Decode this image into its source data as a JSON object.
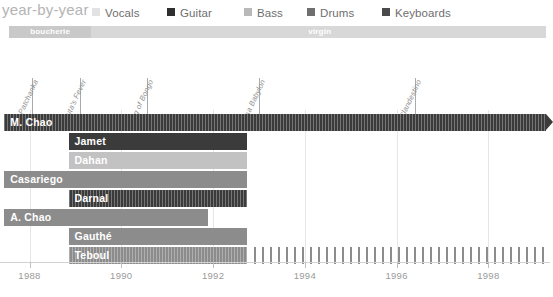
{
  "header": {
    "title": "year-by-year",
    "legend": [
      {
        "label": "Vocals",
        "color": "#e2e2e2",
        "x": 0
      },
      {
        "label": "Guitar",
        "color": "#2f2f2f",
        "x": 75
      },
      {
        "label": "Bass",
        "color": "#b9b9b9",
        "x": 152
      },
      {
        "label": "Drums",
        "color": "#6f6f6f",
        "x": 215
      },
      {
        "label": "Keyboards",
        "color": "#4a4a4a",
        "x": 290
      }
    ]
  },
  "label_band": {
    "segments": [
      {
        "name": "boucherie",
        "start": 1987.55,
        "end": 1989.35
      },
      {
        "name": "virgin",
        "start": 1989.35,
        "end": 1999.3
      }
    ]
  },
  "albums": [
    {
      "title": "Patchanka",
      "year": 1988.05
    },
    {
      "title": "Puta's Fever",
      "year": 1989.1
    },
    {
      "title": "King of Bongo",
      "year": 1990.55
    },
    {
      "title": "Casa Babylon",
      "year": 1993.0
    },
    {
      "title": "Clandestino",
      "year": 1996.4
    }
  ],
  "chart_data": {
    "type": "bar",
    "title": "year-by-year",
    "xlabel": "",
    "ylabel": "",
    "xlim": [
      1987.4,
      1999.3
    ],
    "grid": true,
    "legend_position": "top",
    "xticks": [
      1988,
      1990,
      1992,
      1994,
      1996,
      1998
    ],
    "xticklabels": [
      "1988",
      "1990",
      "1992",
      "1994",
      "1996",
      "1998"
    ],
    "rows": [
      {
        "name": "M. Chao",
        "role": "Vocals",
        "start": 1987.45,
        "end": 1999.25,
        "style": "dark",
        "striped": true,
        "arrow": true,
        "dashed_from": null,
        "dashed_to": null,
        "label_inside": true
      },
      {
        "name": "Jamet",
        "role": "Guitar",
        "start": 1988.85,
        "end": 1992.75,
        "style": "dark",
        "striped": false,
        "arrow": false,
        "dashed_from": null,
        "dashed_to": null,
        "label_inside": true
      },
      {
        "name": "Dahan",
        "role": "Bass",
        "start": 1988.85,
        "end": 1992.75,
        "style": "light",
        "striped": false,
        "arrow": false,
        "dashed_from": null,
        "dashed_to": null,
        "label_inside": true
      },
      {
        "name": "Casariego",
        "role": "Drums",
        "start": 1987.45,
        "end": 1992.75,
        "style": "mid",
        "striped": false,
        "arrow": false,
        "dashed_from": null,
        "dashed_to": null,
        "label_inside": true
      },
      {
        "name": "Darnal",
        "role": "Keyboards",
        "start": 1988.85,
        "end": 1992.75,
        "style": "dark",
        "striped": true,
        "arrow": false,
        "dashed_from": null,
        "dashed_to": null,
        "label_inside": true
      },
      {
        "name": "A. Chao",
        "role": "Drums",
        "start": 1987.45,
        "end": 1991.9,
        "style": "mid",
        "striped": false,
        "arrow": false,
        "dashed_from": null,
        "dashed_to": null,
        "label_inside": true
      },
      {
        "name": "Gauthé",
        "role": "Bass",
        "start": 1988.85,
        "end": 1992.75,
        "style": "mid",
        "striped": false,
        "arrow": false,
        "dashed_from": null,
        "dashed_to": null,
        "label_inside": true
      },
      {
        "name": "Teboul",
        "role": "Keyboards",
        "start": 1988.85,
        "end": 1992.75,
        "style": "mid",
        "striped": true,
        "arrow": false,
        "dashed_from": 1992.9,
        "dashed_to": 1999.25,
        "label_inside": true
      }
    ]
  }
}
